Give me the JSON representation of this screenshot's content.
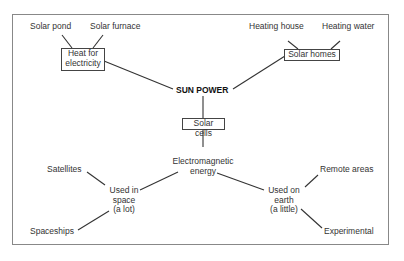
{
  "diagram": {
    "root": "SUN POWER",
    "nodes": {
      "heat_for_electricity": "Heat for electricity",
      "heat_line1": "Heat for",
      "heat_line2": "electricity",
      "solar_pond": "Solar pond",
      "solar_furnace": "Solar furnace",
      "solar_homes": "Solar homes",
      "heating_house": "Heating house",
      "heating_water": "Heating water",
      "solar_cells": "Solar cells",
      "em_line1": "Electromagnetic",
      "em_line2": "energy",
      "space_line1": "Used in",
      "space_line2": "space",
      "space_line3": "(a lot)",
      "earth_line1": "Used on",
      "earth_line2": "earth",
      "earth_line3": "(a little)",
      "satellites": "Satellites",
      "spaceships": "Spaceships",
      "remote_areas": "Remote areas",
      "experimental": "Experimental"
    },
    "edges": [
      [
        "SUN POWER",
        "Heat for electricity"
      ],
      [
        "SUN POWER",
        "Solar homes"
      ],
      [
        "SUN POWER",
        "Solar cells"
      ],
      [
        "Heat for electricity",
        "Solar pond"
      ],
      [
        "Heat for electricity",
        "Solar furnace"
      ],
      [
        "Solar homes",
        "Heating house"
      ],
      [
        "Solar homes",
        "Heating water"
      ],
      [
        "Solar cells",
        "Electromagnetic energy"
      ],
      [
        "Electromagnetic energy",
        "Used in space (a lot)"
      ],
      [
        "Electromagnetic energy",
        "Used on earth (a little)"
      ],
      [
        "Used in space (a lot)",
        "Satellites"
      ],
      [
        "Used in space (a lot)",
        "Spaceships"
      ],
      [
        "Used on earth (a little)",
        "Remote areas"
      ],
      [
        "Used on earth (a little)",
        "Experimental"
      ]
    ]
  }
}
